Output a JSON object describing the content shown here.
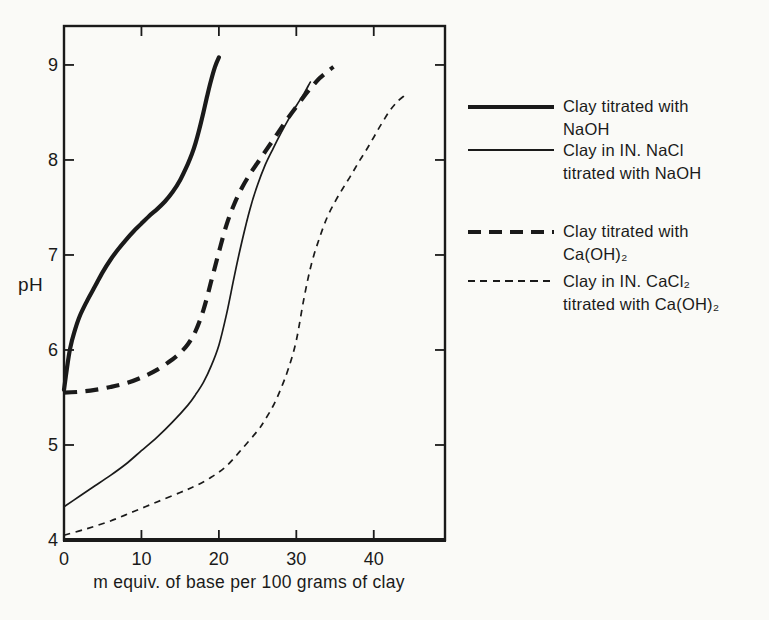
{
  "figure": {
    "background": "#fafaf7",
    "ink": "#1a1a1a"
  },
  "chart_data": {
    "type": "line",
    "title": "",
    "xlabel": "m equiv. of base per 100 grams of clay",
    "ylabel": "pH",
    "xlim": [
      0,
      49.2
    ],
    "ylim": [
      4,
      9.41
    ],
    "x_ticks": [
      0,
      10,
      20,
      30,
      40
    ],
    "y_ticks": [
      4,
      5,
      6,
      7,
      8,
      9
    ],
    "grid": false,
    "tick_style": "inward",
    "frame": "box",
    "legend_position": "right",
    "line_color": "#1a1a1a",
    "series": [
      {
        "key": "clay-naoh",
        "name": "Clay titrated with NaOH",
        "legend_line1": "Clay titrated with",
        "legend_line2": "NaOH",
        "line": "thick-solid",
        "points": [
          [
            0,
            5.58
          ],
          [
            0.4,
            5.82
          ],
          [
            0.8,
            6.02
          ],
          [
            1.3,
            6.18
          ],
          [
            2,
            6.35
          ],
          [
            3,
            6.52
          ],
          [
            4,
            6.67
          ],
          [
            5,
            6.82
          ],
          [
            6,
            6.95
          ],
          [
            7,
            7.06
          ],
          [
            8,
            7.16
          ],
          [
            9,
            7.25
          ],
          [
            10,
            7.33
          ],
          [
            11,
            7.41
          ],
          [
            12,
            7.48
          ],
          [
            13,
            7.56
          ],
          [
            14,
            7.66
          ],
          [
            15,
            7.79
          ],
          [
            16,
            7.96
          ],
          [
            16.5,
            8.06
          ],
          [
            17,
            8.18
          ],
          [
            17.5,
            8.33
          ],
          [
            18,
            8.5
          ],
          [
            18.5,
            8.68
          ],
          [
            19,
            8.84
          ],
          [
            19.5,
            8.98
          ],
          [
            20,
            9.08
          ]
        ]
      },
      {
        "key": "clay-nacl-naoh",
        "name": "Clay in IN. NaCl titrated with NaOH",
        "legend_line1": "Clay in IN. NaCl",
        "legend_line2": "titrated with NaOH",
        "line": "thin-solid",
        "points": [
          [
            0,
            4.35
          ],
          [
            2,
            4.46
          ],
          [
            4,
            4.57
          ],
          [
            6,
            4.68
          ],
          [
            8,
            4.8
          ],
          [
            10,
            4.94
          ],
          [
            12,
            5.08
          ],
          [
            14,
            5.24
          ],
          [
            16,
            5.42
          ],
          [
            17,
            5.53
          ],
          [
            18,
            5.66
          ],
          [
            19,
            5.83
          ],
          [
            20,
            6.05
          ],
          [
            21,
            6.38
          ],
          [
            22,
            6.78
          ],
          [
            23,
            7.15
          ],
          [
            24,
            7.48
          ],
          [
            25,
            7.74
          ],
          [
            26,
            7.95
          ],
          [
            27,
            8.12
          ],
          [
            28,
            8.28
          ],
          [
            29,
            8.43
          ],
          [
            30,
            8.57
          ],
          [
            31,
            8.7
          ],
          [
            31.8,
            8.82
          ]
        ]
      },
      {
        "key": "clay-caoh2",
        "name": "Clay titrated with Ca(OH)₂",
        "legend_line1": "Clay titrated with",
        "legend_line2": "Ca(OH)₂",
        "line": "thick-dashed",
        "points": [
          [
            0,
            5.55
          ],
          [
            2,
            5.56
          ],
          [
            4,
            5.58
          ],
          [
            6,
            5.61
          ],
          [
            8,
            5.65
          ],
          [
            10,
            5.71
          ],
          [
            12,
            5.79
          ],
          [
            14,
            5.9
          ],
          [
            15,
            5.97
          ],
          [
            16,
            6.06
          ],
          [
            17,
            6.2
          ],
          [
            18,
            6.42
          ],
          [
            19,
            6.72
          ],
          [
            20,
            7.03
          ],
          [
            21,
            7.32
          ],
          [
            22,
            7.54
          ],
          [
            23,
            7.71
          ],
          [
            24,
            7.85
          ],
          [
            25,
            7.97
          ],
          [
            26,
            8.09
          ],
          [
            27,
            8.21
          ],
          [
            28,
            8.33
          ],
          [
            29,
            8.45
          ],
          [
            30,
            8.56
          ],
          [
            31,
            8.67
          ],
          [
            32,
            8.77
          ],
          [
            33,
            8.86
          ],
          [
            34,
            8.93
          ],
          [
            34.8,
            8.98
          ]
        ]
      },
      {
        "key": "clay-cacl2-caoh2",
        "name": "Clay in IN. CaCl₂ titrated with Ca(OH)₂",
        "legend_line1": "Clay in IN. CaCl₂",
        "legend_line2": "titrated with Ca(OH)₂",
        "line": "thin-dashed",
        "points": [
          [
            0,
            4.05
          ],
          [
            3,
            4.12
          ],
          [
            6,
            4.2
          ],
          [
            9,
            4.3
          ],
          [
            12,
            4.4
          ],
          [
            15,
            4.5
          ],
          [
            17,
            4.57
          ],
          [
            19,
            4.66
          ],
          [
            21,
            4.78
          ],
          [
            23,
            4.96
          ],
          [
            25,
            5.15
          ],
          [
            26,
            5.27
          ],
          [
            27,
            5.41
          ],
          [
            28,
            5.59
          ],
          [
            29,
            5.81
          ],
          [
            30,
            6.1
          ],
          [
            31,
            6.55
          ],
          [
            32,
            6.92
          ],
          [
            33,
            7.18
          ],
          [
            34,
            7.4
          ],
          [
            35,
            7.56
          ],
          [
            36,
            7.7
          ],
          [
            37,
            7.83
          ],
          [
            38,
            7.97
          ],
          [
            39,
            8.1
          ],
          [
            40,
            8.24
          ],
          [
            41,
            8.38
          ],
          [
            42,
            8.51
          ],
          [
            43,
            8.61
          ],
          [
            44,
            8.68
          ]
        ]
      }
    ]
  },
  "legend": {
    "entries": [
      {
        "line1": "Clay titrated with",
        "line2": "NaOH",
        "style": "thick-solid"
      },
      {
        "line1": "Clay in IN. NaCl",
        "line2": "titrated with NaOH",
        "style": "thin-solid"
      },
      {
        "line1": "Clay titrated with",
        "line2": "Ca(OH)₂",
        "style": "thick-dashed"
      },
      {
        "line1": "Clay in IN. CaCl₂",
        "line2": "titrated with Ca(OH)₂",
        "style": "thin-dashed"
      }
    ]
  }
}
